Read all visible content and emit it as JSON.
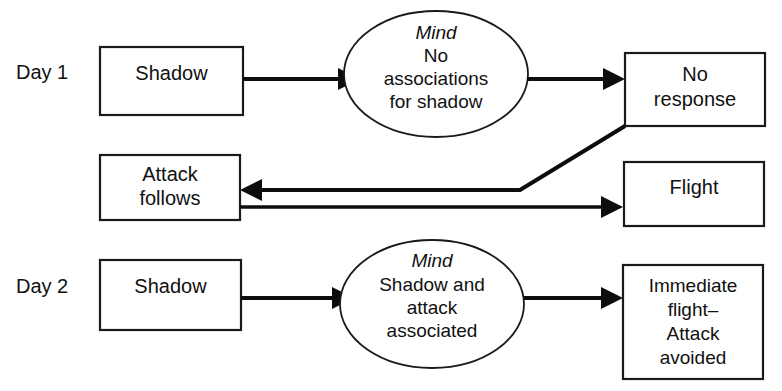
{
  "diagram": {
    "row_labels": [
      {
        "id": "day1",
        "text": "Day 1"
      },
      {
        "id": "day2",
        "text": "Day 2"
      }
    ],
    "nodes": {
      "day1_stimulus": {
        "shape": "rectangle",
        "lines": [
          "Shadow"
        ]
      },
      "day1_mind": {
        "shape": "ellipse",
        "italic_header": "Mind",
        "lines": [
          "No",
          "associations",
          "for shadow"
        ]
      },
      "day1_outcome": {
        "shape": "rectangle",
        "lines": [
          "No",
          "response"
        ]
      },
      "attack_follows": {
        "shape": "rectangle",
        "lines": [
          "Attack",
          "follows"
        ]
      },
      "flight": {
        "shape": "rectangle",
        "lines": [
          "Flight"
        ]
      },
      "day2_stimulus": {
        "shape": "rectangle",
        "lines": [
          "Shadow"
        ]
      },
      "day2_mind": {
        "shape": "ellipse",
        "italic_header": "Mind",
        "lines": [
          "Shadow and",
          "attack",
          "associated"
        ]
      },
      "day2_outcome": {
        "shape": "rectangle",
        "lines": [
          "Immediate",
          "flight–",
          "Attack",
          "avoided"
        ]
      }
    },
    "edges": [
      {
        "id": "day1-stimulus-to-mind",
        "from": "day1_stimulus",
        "to": "day1_mind",
        "arrow": "to"
      },
      {
        "id": "day1-mind-to-outcome",
        "from": "day1_mind",
        "to": "day1_outcome",
        "arrow": "to"
      },
      {
        "id": "no-response-to-attack-follows",
        "from": "day1_outcome",
        "to": "attack_follows",
        "arrow": "to"
      },
      {
        "id": "attack-follows-to-flight",
        "from": "attack_follows",
        "to": "flight",
        "arrow": "to"
      },
      {
        "id": "day2-stimulus-to-mind",
        "from": "day2_stimulus",
        "to": "day2_mind",
        "arrow": "to"
      },
      {
        "id": "day2-mind-to-outcome",
        "from": "day2_mind",
        "to": "day2_outcome",
        "arrow": "to"
      }
    ],
    "colors": {
      "stroke": "#111111",
      "fill": "#ffffff",
      "background": "#ffffff"
    }
  }
}
